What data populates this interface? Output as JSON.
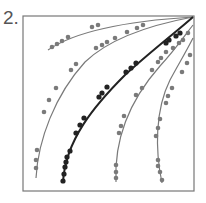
{
  "figure": {
    "label": "2.",
    "frame": {
      "x": 23,
      "y": 16,
      "width": 171,
      "height": 175,
      "stroke": "#777777"
    },
    "colors": {
      "gray": "#7a7a7a",
      "dark": "#222222"
    },
    "curves": [
      {
        "name": "curve-1",
        "color": "gray",
        "stroke_width": 1.2,
        "path": "M48,50 C70,35 110,22 193,17",
        "dots": [
          [
            52,
            47
          ],
          [
            57,
            44
          ],
          [
            62,
            41
          ],
          [
            68,
            37
          ],
          [
            92,
            27
          ],
          [
            98,
            25
          ]
        ]
      },
      {
        "name": "curve-2",
        "color": "gray",
        "stroke_width": 1.2,
        "path": "M36,178 C38,140 55,95 85,62 C110,38 150,25 193,17",
        "dots": [
          [
            36,
            168
          ],
          [
            36,
            160
          ],
          [
            37,
            150
          ],
          [
            44,
            112
          ],
          [
            49,
            100
          ],
          [
            56,
            88
          ],
          [
            71,
            70
          ],
          [
            76,
            64
          ],
          [
            96,
            48
          ],
          [
            102,
            45
          ],
          [
            107,
            42
          ],
          [
            115,
            38
          ],
          [
            127,
            32
          ],
          [
            137,
            28
          ],
          [
            143,
            25
          ]
        ]
      },
      {
        "name": "curve-3",
        "color": "dark",
        "stroke_width": 2,
        "path": "M63,183 C65,140 95,105 125,75 C150,52 175,33 193,17",
        "dots": [
          [
            63,
            181
          ],
          [
            64,
            174
          ],
          [
            65,
            167
          ],
          [
            66,
            162
          ],
          [
            67,
            157
          ],
          [
            70,
            151
          ],
          [
            76,
            133
          ],
          [
            80,
            125
          ],
          [
            84,
            118
          ],
          [
            99,
            97
          ],
          [
            102,
            93
          ],
          [
            107,
            87
          ],
          [
            126,
            72
          ],
          [
            131,
            68
          ],
          [
            136,
            63
          ],
          [
            166,
            43
          ],
          [
            169,
            40
          ],
          [
            176,
            36
          ],
          [
            180,
            33
          ]
        ]
      },
      {
        "name": "curve-4",
        "color": "gray",
        "stroke_width": 1.2,
        "path": "M116,182 C114,140 130,100 160,66 C175,50 185,35 193,25",
        "dots": [
          [
            116,
            178
          ],
          [
            116,
            172
          ],
          [
            116,
            165
          ],
          [
            119,
            133
          ],
          [
            121,
            126
          ],
          [
            124,
            116
          ],
          [
            136,
            95
          ],
          [
            142,
            88
          ],
          [
            152,
            70
          ],
          [
            158,
            62
          ],
          [
            161,
            58
          ],
          [
            166,
            52
          ],
          [
            173,
            48
          ],
          [
            179,
            43
          ],
          [
            183,
            40
          ],
          [
            188,
            33
          ]
        ]
      },
      {
        "name": "curve-5",
        "color": "gray",
        "stroke_width": 1.2,
        "path": "M162,183 C155,150 155,110 170,80 C178,65 186,52 193,38",
        "dots": [
          [
            162,
            180
          ],
          [
            160,
            172
          ],
          [
            158,
            166
          ],
          [
            158,
            160
          ],
          [
            156,
            136
          ],
          [
            158,
            128
          ],
          [
            160,
            119
          ],
          [
            166,
            103
          ],
          [
            168,
            96
          ],
          [
            172,
            88
          ],
          [
            182,
            72
          ],
          [
            187,
            63
          ],
          [
            190,
            55
          ]
        ]
      }
    ]
  }
}
